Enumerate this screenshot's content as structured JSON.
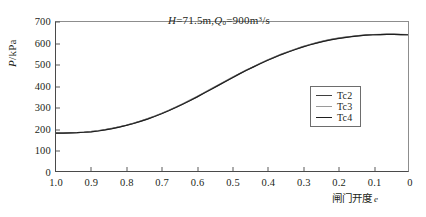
{
  "chart_data": {
    "type": "line",
    "title": "",
    "annotation": {
      "text": "H=71.5m,Q0=900m3/s",
      "variable_h": "H",
      "equals": "=",
      "value_h": "71.5m,",
      "variable_q": "Q",
      "subscript_q": "0",
      "equals2": "=",
      "value_q": "900m",
      "superscript_q": "3",
      "per": "/s"
    },
    "xlabel": "闸门开度",
    "xlabel_symbol": "e",
    "ylabel": "P",
    "ylabel_unit": "/kPa",
    "xlim": [
      1.0,
      0.0
    ],
    "ylim": [
      0,
      700
    ],
    "x_reversed": true,
    "grid": false,
    "legend_position": "right-center",
    "x_ticks": [
      "1.0",
      "0.9",
      "0.8",
      "0.7",
      "0.6",
      "0.5",
      "0.4",
      "0.3",
      "0.2",
      "0.1",
      "0"
    ],
    "x_tick_values": [
      1.0,
      0.9,
      0.8,
      0.7,
      0.6,
      0.5,
      0.4,
      0.3,
      0.2,
      0.1,
      0.0
    ],
    "y_ticks": [
      "0",
      "100",
      "200",
      "300",
      "400",
      "500",
      "600",
      "700"
    ],
    "y_tick_values": [
      0,
      100,
      200,
      300,
      400,
      500,
      600,
      700
    ],
    "x": [
      1.0,
      0.98,
      0.96,
      0.94,
      0.92,
      0.9,
      0.88,
      0.86,
      0.84,
      0.82,
      0.8,
      0.78,
      0.76,
      0.74,
      0.72,
      0.7,
      0.68,
      0.66,
      0.64,
      0.62,
      0.6,
      0.58,
      0.56,
      0.54,
      0.52,
      0.5,
      0.48,
      0.46,
      0.44,
      0.42,
      0.4,
      0.38,
      0.36,
      0.34,
      0.32,
      0.3,
      0.28,
      0.26,
      0.24,
      0.22,
      0.2,
      0.18,
      0.16,
      0.14,
      0.12,
      0.1,
      0.08,
      0.06,
      0.04,
      0.02,
      0.0
    ],
    "series": [
      {
        "name": "Tc2",
        "color": "#3f3f3f",
        "values": [
          178,
          178,
          179,
          180,
          182,
          185,
          189,
          194,
          200,
          207,
          215,
          224,
          234,
          245,
          257,
          270,
          284,
          299,
          315,
          331,
          348,
          366,
          384,
          402,
          420,
          438,
          456,
          473,
          489,
          505,
          520,
          534,
          548,
          560,
          572,
          583,
          593,
          602,
          610,
          617,
          623,
          628,
          632,
          636,
          638,
          640,
          641,
          642,
          642,
          641,
          640
        ]
      },
      {
        "name": "Tc3",
        "color": "#9a9a9a",
        "values": [
          179,
          179,
          180,
          181,
          183,
          186,
          190,
          195,
          201,
          208,
          216,
          225,
          235,
          246,
          258,
          271,
          285,
          300,
          316,
          333,
          350,
          368,
          386,
          404,
          422,
          440,
          457,
          474,
          490,
          506,
          521,
          535,
          549,
          561,
          573,
          584,
          594,
          603,
          611,
          618,
          624,
          629,
          633,
          636,
          639,
          641,
          642,
          643,
          643,
          642,
          641
        ]
      },
      {
        "name": "Tc4",
        "color": "#1f1f1f",
        "values": [
          178,
          178,
          179,
          180,
          182,
          184,
          188,
          193,
          199,
          206,
          214,
          223,
          233,
          244,
          256,
          269,
          283,
          298,
          314,
          330,
          347,
          365,
          383,
          401,
          419,
          437,
          455,
          472,
          488,
          504,
          519,
          533,
          547,
          559,
          571,
          582,
          592,
          601,
          609,
          616,
          622,
          627,
          631,
          635,
          638,
          640,
          641,
          642,
          642,
          641,
          640
        ]
      }
    ]
  },
  "legend": {
    "items": [
      {
        "label": "Tc2",
        "color": "#3f3f3f"
      },
      {
        "label": "Tc3",
        "color": "#9a9a9a"
      },
      {
        "label": "Tc4",
        "color": "#1f1f1f"
      }
    ]
  }
}
